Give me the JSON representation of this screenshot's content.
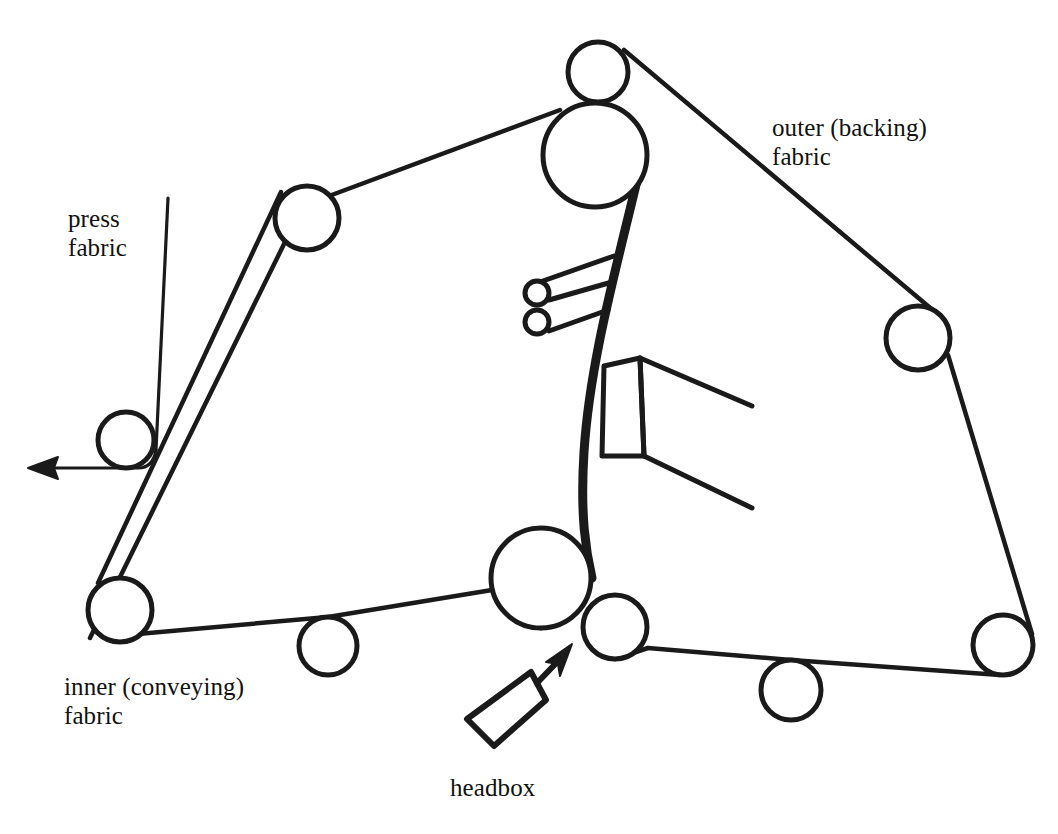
{
  "figure": {
    "type": "diagram",
    "background_color": "#ffffff",
    "stroke_color": "#1a1a1a"
  },
  "labels": {
    "press_fabric": "press\nfabric",
    "outer_fabric": "outer (backing)\nfabric",
    "inner_fabric": "inner (conveying)\nfabric",
    "headbox": "headbox"
  },
  "components": {
    "rollers": [
      {
        "name": "top-roller",
        "cx": 598,
        "cy": 72,
        "r": 30
      },
      {
        "name": "main-press-roller",
        "cx": 595,
        "cy": 155,
        "r": 52
      },
      {
        "name": "upper-left-roller",
        "cx": 307,
        "cy": 218,
        "r": 32
      },
      {
        "name": "press-fabric-roller",
        "cx": 126,
        "cy": 440,
        "r": 28
      },
      {
        "name": "lower-left-roller",
        "cx": 120,
        "cy": 610,
        "r": 32
      },
      {
        "name": "bottom-left-idler",
        "cx": 328,
        "cy": 646,
        "r": 29
      },
      {
        "name": "couch-roller",
        "cx": 541,
        "cy": 578,
        "r": 50
      },
      {
        "name": "forming-roller",
        "cx": 615,
        "cy": 627,
        "r": 32
      },
      {
        "name": "bottom-right-idler",
        "cx": 791,
        "cy": 690,
        "r": 30
      },
      {
        "name": "right-roller",
        "cx": 918,
        "cy": 338,
        "r": 32
      },
      {
        "name": "bottom-right-roller",
        "cx": 1003,
        "cy": 645,
        "r": 30
      },
      {
        "name": "shower-roller-upper",
        "cx": 537,
        "cy": 293,
        "r": 12
      },
      {
        "name": "shower-roller-lower",
        "cx": 537,
        "cy": 322,
        "r": 12
      }
    ],
    "headbox_label_target": "forming-roller",
    "fabric_loops": [
      {
        "name": "inner-conveying-fabric"
      },
      {
        "name": "outer-backing-fabric"
      },
      {
        "name": "press-fabric"
      }
    ],
    "blade_assembly": {
      "name": "doctor-blade-box"
    },
    "flow_arrows": [
      {
        "name": "press-fabric-exit-arrow",
        "direction": "left"
      },
      {
        "name": "headbox-jet-arrow",
        "direction": "up-right"
      }
    ]
  }
}
